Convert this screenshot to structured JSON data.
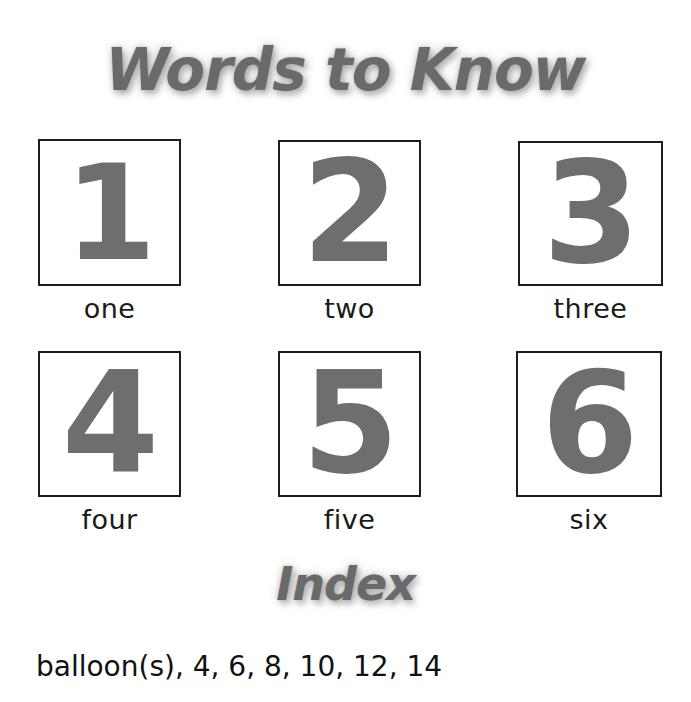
{
  "page": {
    "background_color": "#ffffff",
    "width": 691,
    "height": 702
  },
  "headings": {
    "words_to_know": "Words to Know",
    "index": "Index"
  },
  "colors": {
    "heading_fill": "#6a6a6a",
    "heading_outline": "#ffffff",
    "heading_shadow": "#9a9a9a",
    "numeral_gray": "#6e6e6e",
    "box_border": "#1d1d1d",
    "label_text": "#1a1a1a",
    "index_text": "#111111"
  },
  "number_grid": {
    "rows": 2,
    "columns": 3,
    "cells": [
      {
        "numeral": "1",
        "word": "one",
        "box": {
          "x": 38,
          "y": 139,
          "w": 143,
          "h": 147
        },
        "numeral_font_size": 132
      },
      {
        "numeral": "2",
        "word": "two",
        "box": {
          "x": 278,
          "y": 140,
          "w": 143,
          "h": 146
        },
        "numeral_font_size": 140
      },
      {
        "numeral": "3",
        "word": "three",
        "box": {
          "x": 518,
          "y": 141,
          "w": 145,
          "h": 145
        },
        "numeral_font_size": 140
      },
      {
        "numeral": "4",
        "word": "four",
        "box": {
          "x": 38,
          "y": 351,
          "w": 143,
          "h": 146
        },
        "numeral_font_size": 140
      },
      {
        "numeral": "5",
        "word": "five",
        "box": {
          "x": 278,
          "y": 351,
          "w": 143,
          "h": 146
        },
        "numeral_font_size": 140
      },
      {
        "numeral": "6",
        "word": "six",
        "box": {
          "x": 516,
          "y": 351,
          "w": 146,
          "h": 146
        },
        "numeral_font_size": 140
      }
    ],
    "row_label_tops": [
      293,
      504
    ]
  },
  "index_section": {
    "entries": [
      {
        "text": "balloon(s), 4, 6, 8, 10, 12, 14",
        "term": "balloon(s)",
        "pages": [
          4,
          6,
          8,
          10,
          12,
          14
        ]
      }
    ]
  }
}
